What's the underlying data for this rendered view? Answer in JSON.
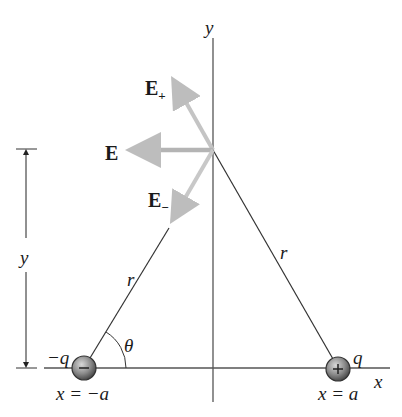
{
  "diagram": {
    "type": "electric dipole field at point on y-axis",
    "axes": {
      "x_label": "x",
      "y_label": "y"
    },
    "vectors": [
      {
        "name": "E",
        "sub": "+",
        "label": "E+"
      },
      {
        "name": "E",
        "sub": "",
        "label": "E"
      },
      {
        "name": "E",
        "sub": "−",
        "label": "E−"
      }
    ],
    "charges": {
      "negative": {
        "label": "−q",
        "position": "x = −a",
        "sign": "−"
      },
      "positive": {
        "label": "q",
        "position": "x = a",
        "sign": "+"
      }
    },
    "distances": {
      "r_left": "r",
      "r_right": "r",
      "height": "y"
    },
    "angle": "θ",
    "colors": {
      "line": "#333333",
      "vector": "#b8b8b8",
      "charge_fill": "#7a7a7a"
    }
  }
}
